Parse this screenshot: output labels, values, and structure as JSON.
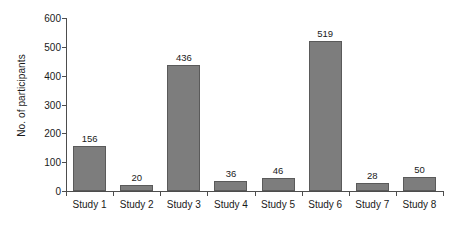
{
  "chart_data": {
    "type": "bar",
    "title": "",
    "xlabel": "",
    "ylabel": "No. of participants",
    "categories": [
      "Study 1",
      "Study 2",
      "Study 3",
      "Study 4",
      "Study 5",
      "Study 6",
      "Study 7",
      "Study 8"
    ],
    "values": [
      156,
      20,
      436,
      36,
      46,
      519,
      28,
      50
    ],
    "value_labels": [
      "156",
      "20",
      "436",
      "36",
      "46",
      "519",
      "28",
      "50"
    ],
    "ylim": [
      0,
      600
    ],
    "yticks": [
      0,
      100,
      200,
      300,
      400,
      500,
      600
    ],
    "ytick_labels": [
      "0",
      "100",
      "200",
      "300",
      "400",
      "500",
      "600"
    ],
    "grid": false,
    "legend": false,
    "bar_color": "#7d7d7d",
    "bar_edge_color": "#5a5a5a",
    "axis_color": "#4d4d4d",
    "text_color": "#1a1a1a",
    "background": "#ffffff"
  }
}
